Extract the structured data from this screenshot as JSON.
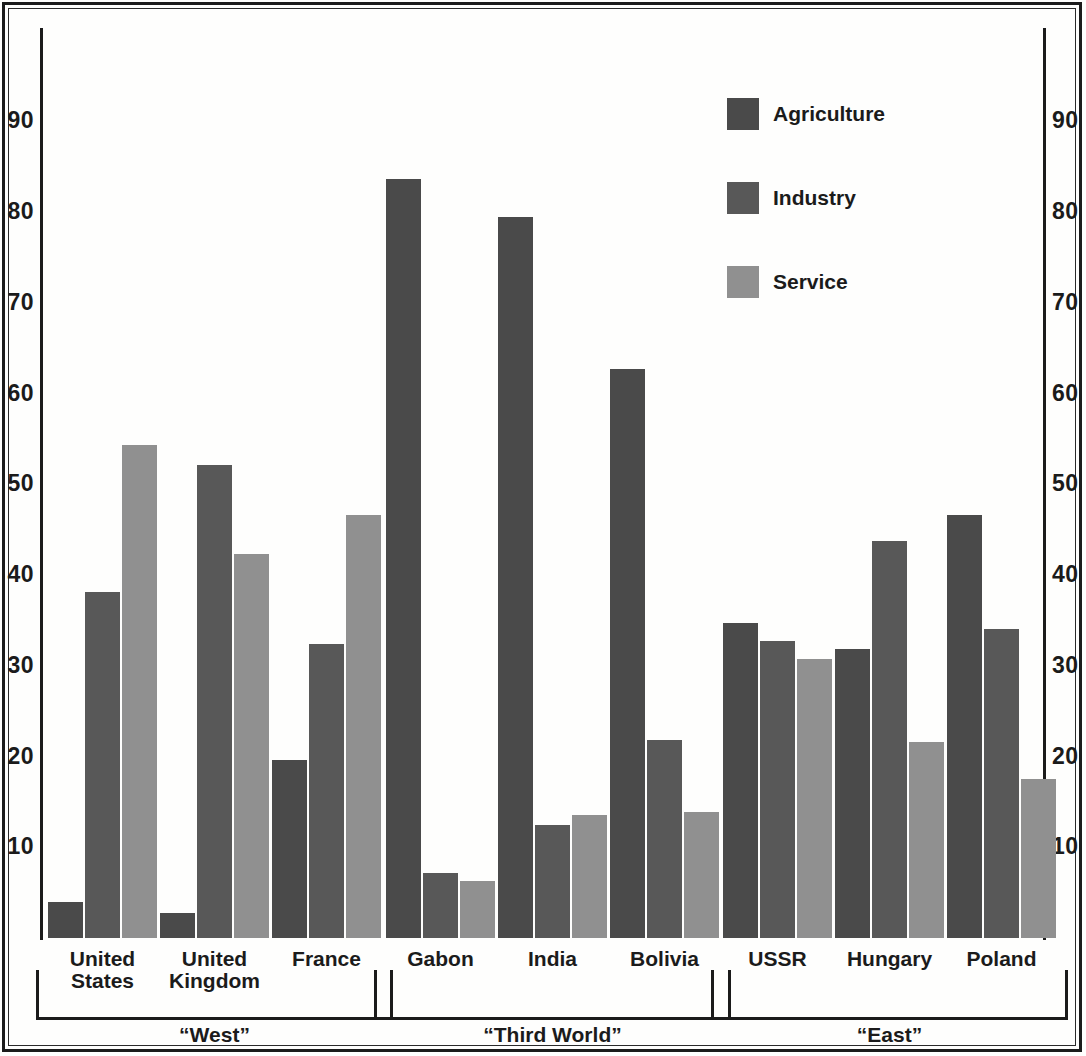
{
  "chart_data": {
    "type": "bar",
    "title": "",
    "subtitle": "",
    "xlabel": "",
    "ylabel": "",
    "ylim": [
      0,
      95
    ],
    "yticks": [
      10,
      20,
      30,
      40,
      50,
      60,
      70,
      80,
      90
    ],
    "grid": false,
    "legend_position": "top-right",
    "axis_sides": [
      "left",
      "right"
    ],
    "categories": [
      "United States",
      "United Kingdom",
      "France",
      "Gabon",
      "India",
      "Bolivia",
      "USSR",
      "Hungary",
      "Poland"
    ],
    "series": [
      {
        "name": "Agriculture",
        "color": "#4a4a4a",
        "values": [
          4.0,
          2.8,
          19.6,
          83.6,
          79.4,
          62.7,
          34.7,
          31.8,
          46.6
        ]
      },
      {
        "name": "Industry",
        "color": "#585858",
        "values": [
          38.1,
          52.1,
          32.4,
          7.2,
          12.5,
          21.8,
          32.7,
          43.8,
          34.1
        ]
      },
      {
        "name": "Service",
        "color": "#909090",
        "values": [
          54.3,
          42.3,
          46.6,
          6.3,
          13.6,
          13.9,
          30.8,
          21.6,
          17.5
        ]
      }
    ],
    "groups": [
      {
        "label": "“West”",
        "members": [
          "United States",
          "United Kingdom",
          "France"
        ]
      },
      {
        "label": "“Third World”",
        "members": [
          "Gabon",
          "India",
          "Bolivia"
        ]
      },
      {
        "label": "“East”",
        "members": [
          "USSR",
          "Hungary",
          "Poland"
        ]
      }
    ]
  },
  "axis": {
    "left_ticks": [
      "90",
      "80",
      "70",
      "60",
      "50",
      "40",
      "30",
      "20",
      "10"
    ],
    "right_ticks": [
      "90",
      "80",
      "70",
      "60",
      "50",
      "40",
      "30",
      "20",
      "10"
    ]
  },
  "legend": {
    "items": [
      {
        "label": "Agriculture",
        "color": "#4a4a4a"
      },
      {
        "label": "Industry",
        "color": "#585858"
      },
      {
        "label": "Service",
        "color": "#909090"
      }
    ]
  },
  "country_labels": [
    "United\nStates",
    "United\nKingdom",
    "France",
    "Gabon",
    "India",
    "Bolivia",
    "USSR",
    "Hungary",
    "Poland"
  ],
  "group_labels": [
    "“West”",
    "“Third World”",
    "“East”"
  ],
  "colors": {
    "agriculture": "#4a4a4a",
    "industry": "#585858",
    "service": "#909090",
    "ink": "#1b1b1b",
    "paper": "#fefefd"
  }
}
